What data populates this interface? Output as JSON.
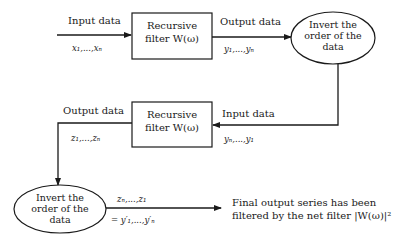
{
  "diagram": {
    "boxes": [
      {
        "id": "filter1",
        "line1": "Recursive",
        "line2": "filter W(ω)"
      },
      {
        "id": "filter2",
        "line1": "Recursive",
        "line2": "filter W(ω)"
      }
    ],
    "ellipses": [
      {
        "id": "invert1",
        "line1": "Invert the",
        "line2": "order of the",
        "line3": "data"
      },
      {
        "id": "invert2",
        "line1": "Invert the",
        "line2": "order of the",
        "line3": "data"
      }
    ],
    "labels": {
      "input1": "Input data",
      "input1_series": "x₁,...,xₙ",
      "output1": "Output data",
      "output1_series": "y₁,...,yₙ",
      "input2": "Input data",
      "input2_series": "yₙ,...,y₁",
      "output2": "Output data",
      "output2_series": "z₁,...,zₙ",
      "reversed_series": "zₙ,...,z₁",
      "reversed_equals": "= y′₁,...,y′ₙ"
    },
    "final": {
      "line1": "Final output series has been",
      "line2": "filtered by the net filter |W(ω)|²"
    },
    "stroke_color": "#1a1a1a"
  }
}
